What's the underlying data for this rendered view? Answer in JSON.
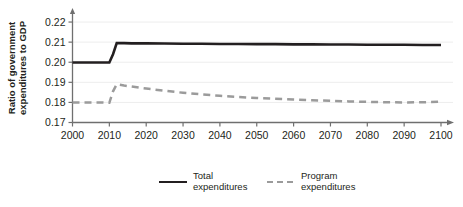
{
  "chart_data": {
    "type": "line",
    "title": "",
    "subtitle": "",
    "xlabel": "",
    "ylabel": "Ratio of government expenditures to GDP",
    "ylabel_line1": "Ratio of government",
    "ylabel_line2": "expenditures to GDP",
    "xlim": [
      2000,
      2100
    ],
    "ylim": [
      0.17,
      0.225
    ],
    "xticks": [
      2000,
      2010,
      2020,
      2030,
      2040,
      2050,
      2060,
      2070,
      2080,
      2090,
      2100
    ],
    "xtick_labels": [
      "2000",
      "2010",
      "2020",
      "2030",
      "2040",
      "2050",
      "2060",
      "2070",
      "2080",
      "2090",
      "2100"
    ],
    "yticks": [
      0.17,
      0.18,
      0.19,
      0.2,
      0.21,
      0.22
    ],
    "ytick_labels": [
      "0.17",
      "0.18",
      "0.19",
      "0.20",
      "0.21",
      "0.22"
    ],
    "grid": "horizontal-faint",
    "legend_position": "bottom-center",
    "x": [
      2000,
      2002,
      2004,
      2006,
      2008,
      2010,
      2011,
      2012,
      2014,
      2016,
      2018,
      2020,
      2025,
      2030,
      2035,
      2040,
      2045,
      2050,
      2055,
      2060,
      2065,
      2070,
      2075,
      2080,
      2085,
      2090,
      2095,
      2100
    ],
    "series": [
      {
        "name": "Total expenditures",
        "color": "#231f20",
        "style": "solid",
        "values": [
          0.1999,
          0.1999,
          0.1999,
          0.1999,
          0.1999,
          0.1999,
          0.204,
          0.2095,
          0.2095,
          0.2094,
          0.2094,
          0.2094,
          0.2093,
          0.2092,
          0.2092,
          0.2091,
          0.2091,
          0.209,
          0.209,
          0.2089,
          0.2089,
          0.2088,
          0.2088,
          0.2087,
          0.2087,
          0.2087,
          0.2086,
          0.2086
        ]
      },
      {
        "name": "Program expenditures",
        "color": "#9b9b9b",
        "style": "dashed",
        "values": [
          0.18,
          0.18,
          0.18,
          0.18,
          0.18,
          0.1798,
          0.1855,
          0.189,
          0.1884,
          0.1879,
          0.1874,
          0.1869,
          0.1858,
          0.1848,
          0.184,
          0.1833,
          0.1827,
          0.1822,
          0.1818,
          0.1814,
          0.1811,
          0.1808,
          0.1805,
          0.1803,
          0.1801,
          0.18,
          0.1801,
          0.1803
        ]
      }
    ],
    "legend": [
      {
        "label_line1": "Total",
        "label_line2": "expenditures",
        "style": "solid",
        "color": "#231f20"
      },
      {
        "label_line1": "Program",
        "label_line2": "expenditures",
        "style": "dashed",
        "color": "#9b9b9b"
      }
    ]
  }
}
